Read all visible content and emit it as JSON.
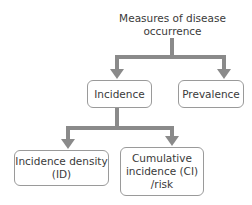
{
  "diagram": {
    "title": {
      "line1": "Measures of disease",
      "line2": "occurrence"
    },
    "nodes": {
      "incidence": {
        "label": "Incidence"
      },
      "prevalence": {
        "label": "Prevalence"
      },
      "incidence_density": {
        "line1": "Incidence density",
        "line2": "(ID)"
      },
      "cumulative_incidence": {
        "line1": "Cumulative",
        "line2": "incidence (CI)",
        "line3": "/risk"
      }
    },
    "edges": [
      {
        "from": "title",
        "to": "incidence"
      },
      {
        "from": "title",
        "to": "prevalence"
      },
      {
        "from": "incidence",
        "to": "incidence_density"
      },
      {
        "from": "incidence",
        "to": "cumulative_incidence"
      }
    ],
    "colors": {
      "line": "#8a8a8a",
      "border": "#9a9a9a",
      "text": "#3a3a3a"
    }
  }
}
